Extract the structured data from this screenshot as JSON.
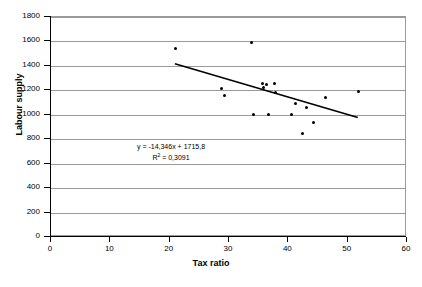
{
  "chart_data": {
    "type": "scatter",
    "title": "",
    "xlabel": "Tax ratio",
    "ylabel": "Labour supply",
    "xlim": [
      0,
      60
    ],
    "ylim": [
      0,
      1800
    ],
    "xticks": [
      0,
      10,
      20,
      30,
      40,
      50,
      60
    ],
    "yticks": [
      0,
      200,
      400,
      600,
      800,
      1000,
      1200,
      1400,
      1600,
      1800
    ],
    "grid": "horizontal",
    "legend": "none",
    "points": [
      {
        "x": 21.0,
        "y": 1540
      },
      {
        "x": 28.8,
        "y": 1215
      },
      {
        "x": 29.2,
        "y": 1160
      },
      {
        "x": 33.8,
        "y": 1595
      },
      {
        "x": 34.2,
        "y": 1002
      },
      {
        "x": 35.6,
        "y": 1255
      },
      {
        "x": 35.8,
        "y": 1222
      },
      {
        "x": 36.3,
        "y": 1248
      },
      {
        "x": 36.6,
        "y": 1000
      },
      {
        "x": 37.6,
        "y": 1258
      },
      {
        "x": 37.9,
        "y": 1185
      },
      {
        "x": 40.5,
        "y": 1000
      },
      {
        "x": 41.2,
        "y": 1090
      },
      {
        "x": 42.4,
        "y": 848
      },
      {
        "x": 43.0,
        "y": 1060
      },
      {
        "x": 44.3,
        "y": 940
      },
      {
        "x": 46.2,
        "y": 1140
      },
      {
        "x": 51.8,
        "y": 1190
      }
    ],
    "trendline": {
      "slope": -14.346,
      "intercept": 1715.8,
      "x_start": 21.0,
      "x_end": 52.0,
      "equation_label": "y = -14,346x + 1715,8",
      "r2_prefix": "R",
      "r2_exponent": "2",
      "r2_label": " = 0,3091",
      "r2_value": 0.3091
    }
  },
  "axis": {
    "x_tick_labels": [
      "0",
      "10",
      "20",
      "30",
      "40",
      "50",
      "60"
    ],
    "y_tick_labels": [
      "0",
      "200",
      "400",
      "600",
      "800",
      "1000",
      "1200",
      "1400",
      "1600",
      "1800"
    ],
    "x_title": "Tax ratio",
    "y_title": "Labour supply"
  },
  "caption": ""
}
